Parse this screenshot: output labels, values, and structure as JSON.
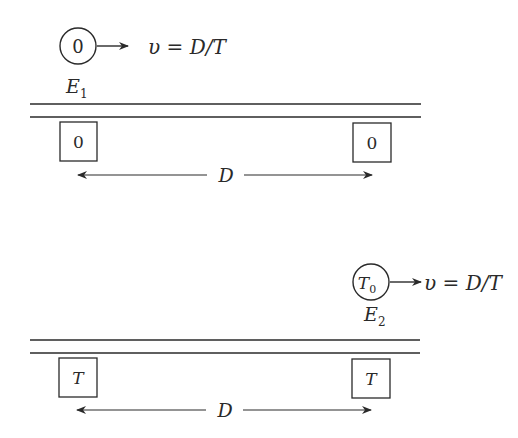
{
  "diagram": {
    "frame1": {
      "clock_reading": "0",
      "velocity_label": "υ = D/T",
      "event_label": "E",
      "event_subscript": "1",
      "station_clocks": [
        "0",
        "0"
      ],
      "distance_label": "D"
    },
    "frame2": {
      "clock_reading": "T",
      "clock_subscript": "0",
      "velocity_label": "υ = D/T",
      "event_label": "E",
      "event_subscript": "2",
      "station_clocks": [
        "T",
        "T"
      ],
      "distance_label": "D"
    }
  }
}
